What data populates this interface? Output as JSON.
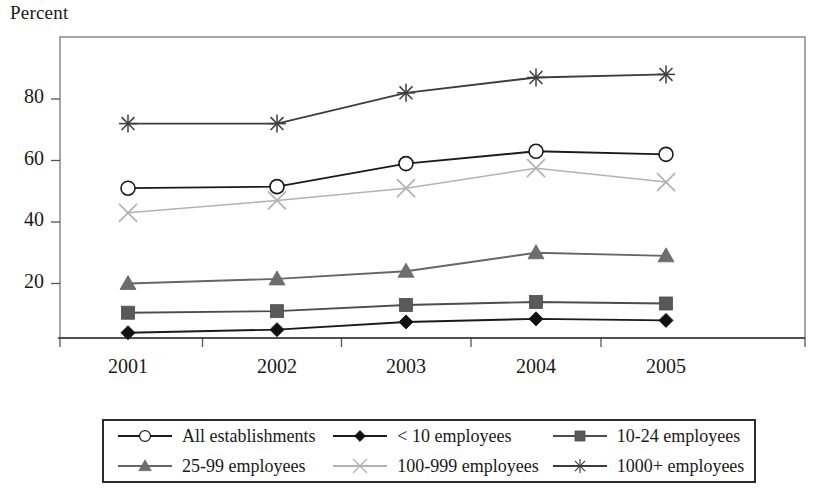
{
  "chart_data": {
    "type": "line",
    "title": "",
    "ylabel": "Percent",
    "xlabel": "",
    "categories": [
      "2001",
      "2002",
      "2003",
      "2004",
      "2005"
    ],
    "ylim": [
      0,
      95
    ],
    "yticks": [
      20,
      40,
      60,
      80
    ],
    "ytick_labels": [
      "20",
      "40",
      "60",
      "80"
    ],
    "grid": false,
    "legend_position": "bottom",
    "series": [
      {
        "name": "All establishments",
        "marker": "open-circle",
        "color": "#1a1a1a",
        "marker_fill": "#ffffff",
        "values": [
          51,
          51.5,
          59,
          63,
          62
        ]
      },
      {
        "name": "< 10 employees",
        "marker": "filled-diamond",
        "color": "#1a1a1a",
        "marker_fill": "#111111",
        "values": [
          4,
          5,
          7.5,
          8.5,
          8
        ]
      },
      {
        "name": "10-24 employees",
        "marker": "filled-square",
        "color": "#4d4d4d",
        "marker_fill": "#595959",
        "values": [
          10.5,
          11,
          13,
          14,
          13.5
        ]
      },
      {
        "name": "25-99 employees",
        "marker": "filled-triangle",
        "color": "#666666",
        "marker_fill": "#6e6e6e",
        "values": [
          20,
          21.5,
          24,
          30,
          29
        ]
      },
      {
        "name": "100-999 employees",
        "marker": "x-cross",
        "color": "#b3b3b3",
        "marker_fill": "#b3b3b3",
        "values": [
          43,
          47,
          51,
          57.5,
          53
        ]
      },
      {
        "name": "1000+ employees",
        "marker": "asterisk",
        "color": "#3d3d3d",
        "marker_fill": "#3d3d3d",
        "values": [
          72,
          72,
          82,
          87,
          88
        ]
      }
    ]
  },
  "axis": {
    "frame_color": "#808080"
  }
}
